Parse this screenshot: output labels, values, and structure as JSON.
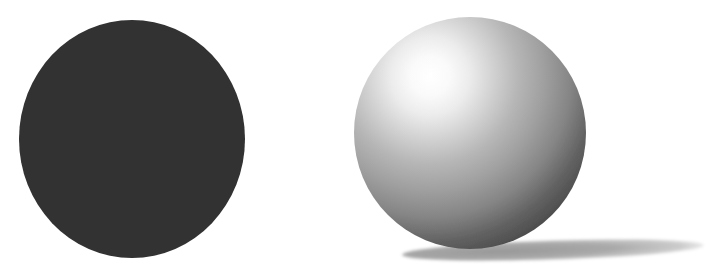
{
  "page": {
    "background": "#ffffff"
  },
  "figure": {
    "flat_circle": {
      "fill": "#313131"
    },
    "sphere": {
      "highlight_color": "#ffffff",
      "terminator_color": "#424242",
      "gradient_stops": [
        {
          "offset": "0%",
          "color": "#ffffff",
          "opacity": "1"
        },
        {
          "offset": "10%",
          "color": "#fafafa",
          "opacity": "1"
        },
        {
          "offset": "20%",
          "color": "#ececec",
          "opacity": "1"
        },
        {
          "offset": "32%",
          "color": "#d2d2d2",
          "opacity": "1"
        },
        {
          "offset": "45%",
          "color": "#b6b6b6",
          "opacity": "1"
        },
        {
          "offset": "58%",
          "color": "#a0a0a0",
          "opacity": "1"
        },
        {
          "offset": "72%",
          "color": "#858585",
          "opacity": "1"
        },
        {
          "offset": "85%",
          "color": "#616161",
          "opacity": "1"
        },
        {
          "offset": "100%",
          "color": "#424242",
          "opacity": "1"
        }
      ]
    },
    "cast_shadow": {
      "gradient_stops": [
        {
          "offset": "0%",
          "color": "#989898",
          "opacity": "1"
        },
        {
          "offset": "50%",
          "color": "#a9a9a9",
          "opacity": "1"
        },
        {
          "offset": "80%",
          "color": "#c3c3c3",
          "opacity": "0.85"
        },
        {
          "offset": "100%",
          "color": "#d9d9d9",
          "opacity": "0"
        }
      ]
    }
  }
}
